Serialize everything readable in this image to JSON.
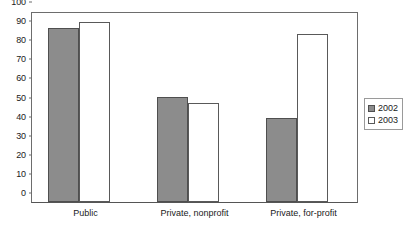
{
  "chart_data": {
    "type": "bar",
    "title": "",
    "subtitle": "",
    "xlabel": "",
    "ylabel": "",
    "categories": [
      "Public",
      "Private, nonprofit",
      "Private, for-profit"
    ],
    "series": [
      {
        "name": "2002",
        "color": "#8c8c8c",
        "values": [
          91,
          55,
          44
        ]
      },
      {
        "name": "2003",
        "color": "#ffffff",
        "values": [
          94,
          52,
          88
        ]
      }
    ],
    "ylim": [
      0,
      100
    ],
    "ytick_step": 10,
    "yticks": [
      100,
      90,
      80,
      70,
      60,
      50,
      40,
      30,
      20,
      10,
      0
    ],
    "ytick_labels": [
      "100",
      "90",
      "80",
      "70",
      "60",
      "50",
      "40",
      "30",
      "20",
      "10",
      "0"
    ],
    "grid": false,
    "legend_position": "right",
    "legend_entries": [
      "2002",
      "2003"
    ],
    "annotations": []
  }
}
